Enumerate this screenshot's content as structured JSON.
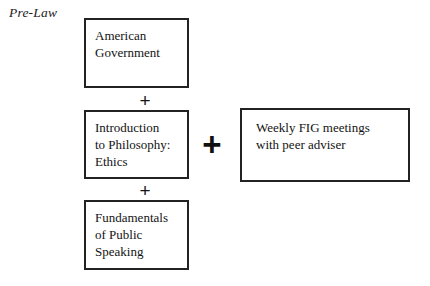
{
  "diagram": {
    "type": "flowchart",
    "track_title": "Pre-Law",
    "nodes": [
      {
        "id": "american-government",
        "lines": [
          "American",
          "Government"
        ],
        "column": "courses",
        "order": 1
      },
      {
        "id": "intro-philosophy",
        "lines": [
          "Introduction",
          "to Philosophy:",
          "Ethics"
        ],
        "column": "courses",
        "order": 2
      },
      {
        "id": "fundamentals-speaking",
        "lines": [
          "Fundamentals",
          "of Public",
          "Speaking"
        ],
        "column": "courses",
        "order": 3
      },
      {
        "id": "weekly-fig",
        "lines": [
          "Weekly FIG meetings",
          "with peer adviser"
        ],
        "column": "activity",
        "order": 1
      }
    ],
    "connectors": [
      {
        "id": "plus-ag-ip",
        "symbol": "+",
        "size": "small",
        "joins": [
          "american-government",
          "intro-philosophy"
        ]
      },
      {
        "id": "plus-ip-fs",
        "symbol": "+",
        "size": "small",
        "joins": [
          "intro-philosophy",
          "fundamentals-speaking"
        ]
      },
      {
        "id": "plus-courses-fig",
        "symbol": "+",
        "size": "large",
        "joins": [
          "courses-stack",
          "weekly-fig"
        ]
      }
    ],
    "colors": {
      "background": "#ffffff",
      "border": "#222222",
      "text": "#131313"
    }
  }
}
